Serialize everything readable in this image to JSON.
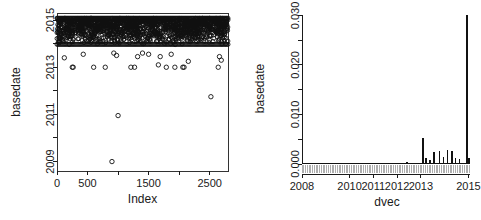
{
  "figure": {
    "title": "",
    "panels": 2,
    "background": "#ffffff",
    "foreground": "#111111"
  },
  "chart_data": [
    {
      "type": "scatter",
      "panel": "left",
      "title": "",
      "xlabel": "Index",
      "ylabel": "basedate",
      "xlim": [
        0,
        2800
      ],
      "ylim": [
        2008.6,
        2015.3
      ],
      "grid": false,
      "legend": null,
      "xticks": [
        0,
        500,
        1000,
        1500,
        2000,
        2500
      ],
      "xticklabels": [
        "0",
        "500",
        "",
        "1500",
        "",
        "2500"
      ],
      "yticks": [
        2009,
        2010,
        2011,
        2012,
        2013,
        2014,
        2015
      ],
      "yticklabels": [
        "2009",
        "",
        "2011",
        "",
        "2013",
        "",
        "2015"
      ],
      "marker": "open-circle",
      "note": "Dense band of points occupies 2014.0-2015.05; sparse outliers below.",
      "dense_band": {
        "y_min": 2013.95,
        "y_max": 2015.08,
        "approx_n": 2650
      },
      "outliers": [
        {
          "x": 120,
          "y": 2013.4
        },
        {
          "x": 250,
          "y": 2013.0
        },
        {
          "x": 265,
          "y": 2013.0
        },
        {
          "x": 430,
          "y": 2013.55
        },
        {
          "x": 600,
          "y": 2013.0
        },
        {
          "x": 790,
          "y": 2013.0
        },
        {
          "x": 900,
          "y": 2009.0
        },
        {
          "x": 930,
          "y": 2013.6
        },
        {
          "x": 975,
          "y": 2013.5
        },
        {
          "x": 1000,
          "y": 2010.95
        },
        {
          "x": 1210,
          "y": 2013.0
        },
        {
          "x": 1270,
          "y": 2013.0
        },
        {
          "x": 1320,
          "y": 2013.45
        },
        {
          "x": 1400,
          "y": 2013.6
        },
        {
          "x": 1500,
          "y": 2013.55
        },
        {
          "x": 1660,
          "y": 2013.1
        },
        {
          "x": 1690,
          "y": 2013.45
        },
        {
          "x": 1790,
          "y": 2013.0
        },
        {
          "x": 1870,
          "y": 2013.55
        },
        {
          "x": 1930,
          "y": 2013.0
        },
        {
          "x": 2060,
          "y": 2013.0
        },
        {
          "x": 2080,
          "y": 2013.0
        },
        {
          "x": 2150,
          "y": 2013.25
        },
        {
          "x": 2520,
          "y": 2011.75
        },
        {
          "x": 2640,
          "y": 2013.0
        },
        {
          "x": 2660,
          "y": 2013.45
        },
        {
          "x": 2690,
          "y": 2013.3
        }
      ]
    },
    {
      "type": "line",
      "panel": "right",
      "title": "",
      "xlabel": "dvec",
      "ylabel": "basedate",
      "xlim": [
        2008.0,
        2015.15
      ],
      "ylim": [
        0.0,
        0.0305
      ],
      "grid": false,
      "legend": null,
      "xticks": [
        2008,
        2010,
        2011,
        2012,
        2013,
        2015
      ],
      "xticklabels": [
        "2008",
        "2010",
        "2011",
        "2012",
        "2013",
        "2015"
      ],
      "yticks": [
        0.0,
        0.005,
        0.01,
        0.015,
        0.02,
        0.025,
        0.03
      ],
      "yticklabels": [
        "0.000",
        "",
        "0.010",
        "",
        "0.020",
        "",
        "0.030"
      ],
      "rug": true,
      "rug_range": [
        2008.0,
        2015.05
      ],
      "rug_count": 96,
      "spikes": [
        {
          "x": 2012.42,
          "y": 0.00035
        },
        {
          "x": 2013.08,
          "y": 0.0053
        },
        {
          "x": 2013.22,
          "y": 0.0013
        },
        {
          "x": 2013.38,
          "y": 0.00075
        },
        {
          "x": 2013.55,
          "y": 0.0025
        },
        {
          "x": 2013.78,
          "y": 0.0026
        },
        {
          "x": 2013.95,
          "y": 0.0014
        },
        {
          "x": 2014.12,
          "y": 0.0028
        },
        {
          "x": 2014.3,
          "y": 0.0027
        },
        {
          "x": 2014.45,
          "y": 0.0013
        },
        {
          "x": 2014.62,
          "y": 0.001
        },
        {
          "x": 2014.95,
          "y": 0.03
        },
        {
          "x": 2015.02,
          "y": 0.0012
        }
      ],
      "baseline_y": 0.00018
    }
  ]
}
